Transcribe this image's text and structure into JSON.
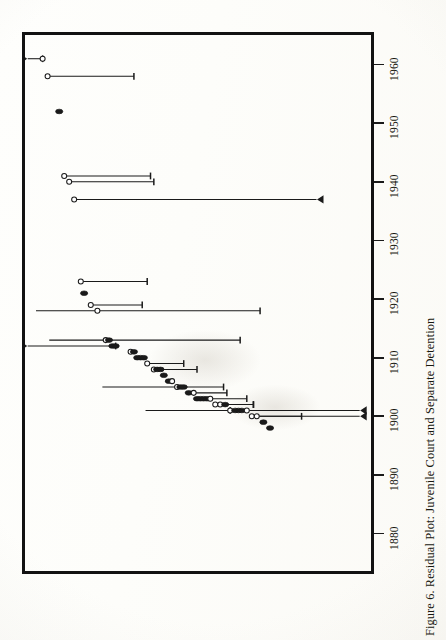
{
  "figure": {
    "caption": "Figure 6.  Residual Plot: Juvenile Court and Separate Detention",
    "caption_number": "Figure 6.",
    "caption_title": "Residual Plot: Juvenile Court and Separate Detention",
    "orientation": "rotated-90-ccw",
    "frame_color": "#121212",
    "ink_color": "#1a1a1a",
    "paper_color": "#fdfdfb"
  },
  "chart_data": {
    "type": "scatter",
    "title": "Residual Plot: Juvenile Court and Separate Detention",
    "xlabel": "",
    "ylabel": "",
    "orientation": "horizontal-intervals",
    "grid": false,
    "legend": null,
    "axis": {
      "name": "year",
      "position": "right",
      "direction": "bottom-to-top",
      "ticks": [
        1880,
        1890,
        1900,
        1910,
        1920,
        1930,
        1940,
        1950,
        1960
      ],
      "tick_labels": [
        "1880",
        "1890",
        "1900",
        "1910",
        "1920",
        "1930",
        "1940",
        "1950",
        "1960"
      ],
      "range": [
        1876,
        1963
      ]
    },
    "residual_axis": {
      "name": "residual",
      "direction": "left-to-right-is-negative",
      "range": [
        -1.0,
        1.0
      ],
      "labeled": false
    },
    "note": "Each observation is a year with a point estimate (circle) and an interval whisker. Open circles = one state group, filled circles = the other. Arrowheads mark intervals truncated by the plot frame.",
    "points": [
      {
        "year": 1961,
        "residual": 0.93,
        "marker": "open",
        "lo": 0.93,
        "hi": 1.02,
        "truncated_hi": true
      },
      {
        "year": 1958,
        "residual": 0.9,
        "marker": "open",
        "lo": 0.38,
        "hi": 0.9,
        "truncated_hi": false
      },
      {
        "year": 1952,
        "residual": 0.83,
        "marker": "filled",
        "lo": 0.83,
        "hi": 0.83,
        "truncated_hi": false
      },
      {
        "year": 1941,
        "residual": 0.8,
        "marker": "open",
        "lo": 0.28,
        "hi": 0.8,
        "truncated_hi": false
      },
      {
        "year": 1940,
        "residual": 0.77,
        "marker": "open",
        "lo": 0.26,
        "hi": 0.77,
        "truncated_hi": false
      },
      {
        "year": 1937,
        "residual": 0.74,
        "marker": "open",
        "lo": -0.72,
        "hi": 0.74,
        "truncated_lo": true
      },
      {
        "year": 1923,
        "residual": 0.7,
        "marker": "open",
        "lo": 0.3,
        "hi": 0.7,
        "truncated_hi": false
      },
      {
        "year": 1921,
        "residual": 0.68,
        "marker": "filled",
        "lo": 0.68,
        "hi": 0.68,
        "truncated_hi": false
      },
      {
        "year": 1919,
        "residual": 0.64,
        "marker": "open",
        "lo": 0.33,
        "hi": 0.64,
        "truncated_hi": false
      },
      {
        "year": 1918,
        "residual": 0.6,
        "marker": "open",
        "lo": -0.38,
        "hi": 0.97,
        "truncated_hi": false
      },
      {
        "year": 1913,
        "residual": 0.55,
        "marker": "open",
        "lo": -0.26,
        "hi": 0.89,
        "truncated_hi": false
      },
      {
        "year": 1913,
        "residual": 0.53,
        "marker": "filled",
        "lo": 0.53,
        "hi": 0.53,
        "truncated_hi": false
      },
      {
        "year": 1912,
        "residual": 0.51,
        "marker": "filled",
        "lo": 0.51,
        "hi": 0.51,
        "truncated_hi": false
      },
      {
        "year": 1912,
        "residual": 0.49,
        "marker": "filled",
        "lo": 0.49,
        "hi": 1.02,
        "truncated_hi": true
      },
      {
        "year": 1911,
        "residual": 0.4,
        "marker": "open",
        "lo": 0.4,
        "hi": 0.4,
        "truncated_hi": false
      },
      {
        "year": 1911,
        "residual": 0.38,
        "marker": "filled",
        "lo": 0.38,
        "hi": 0.38,
        "truncated_hi": false
      },
      {
        "year": 1910,
        "residual": 0.36,
        "marker": "filled",
        "lo": 0.36,
        "hi": 0.36,
        "truncated_hi": false
      },
      {
        "year": 1910,
        "residual": 0.34,
        "marker": "filled",
        "lo": 0.34,
        "hi": 0.34,
        "truncated_hi": false
      },
      {
        "year": 1910,
        "residual": 0.32,
        "marker": "filled",
        "lo": 0.32,
        "hi": 0.32,
        "truncated_hi": false
      },
      {
        "year": 1909,
        "residual": 0.3,
        "marker": "open",
        "lo": 0.08,
        "hi": 0.3,
        "truncated_hi": false
      },
      {
        "year": 1908,
        "residual": 0.26,
        "marker": "open",
        "lo": 0.0,
        "hi": 0.26,
        "truncated_hi": false
      },
      {
        "year": 1908,
        "residual": 0.24,
        "marker": "filled",
        "lo": 0.24,
        "hi": 0.24,
        "truncated_hi": false
      },
      {
        "year": 1908,
        "residual": 0.22,
        "marker": "filled",
        "lo": 0.22,
        "hi": 0.22,
        "truncated_hi": false
      },
      {
        "year": 1907,
        "residual": 0.2,
        "marker": "filled",
        "lo": 0.2,
        "hi": 0.2,
        "truncated_hi": false
      },
      {
        "year": 1906,
        "residual": 0.17,
        "marker": "filled",
        "lo": 0.17,
        "hi": 0.17,
        "truncated_hi": false
      },
      {
        "year": 1906,
        "residual": 0.15,
        "marker": "open",
        "lo": 0.15,
        "hi": 0.15,
        "truncated_hi": false
      },
      {
        "year": 1905,
        "residual": 0.12,
        "marker": "open",
        "lo": -0.16,
        "hi": 0.57,
        "truncated_hi": false
      },
      {
        "year": 1905,
        "residual": 0.1,
        "marker": "filled",
        "lo": 0.1,
        "hi": 0.1,
        "truncated_hi": false
      },
      {
        "year": 1905,
        "residual": 0.08,
        "marker": "filled",
        "lo": 0.08,
        "hi": 0.08,
        "truncated_hi": false
      },
      {
        "year": 1904,
        "residual": 0.05,
        "marker": "filled",
        "lo": 0.05,
        "hi": 0.05,
        "truncated_hi": false
      },
      {
        "year": 1904,
        "residual": 0.02,
        "marker": "open",
        "lo": -0.18,
        "hi": 0.02,
        "truncated_hi": false
      },
      {
        "year": 1903,
        "residual": 0.0,
        "marker": "filled",
        "lo": 0.0,
        "hi": 0.0,
        "truncated_hi": false
      },
      {
        "year": 1903,
        "residual": -0.02,
        "marker": "filled",
        "lo": -0.02,
        "hi": -0.02,
        "truncated_hi": false
      },
      {
        "year": 1903,
        "residual": -0.04,
        "marker": "filled",
        "lo": -0.04,
        "hi": -0.04,
        "truncated_hi": false
      },
      {
        "year": 1903,
        "residual": -0.06,
        "marker": "filled",
        "lo": -0.06,
        "hi": -0.06,
        "truncated_hi": false
      },
      {
        "year": 1903,
        "residual": -0.08,
        "marker": "open",
        "lo": -0.3,
        "hi": -0.08,
        "truncated_hi": false
      },
      {
        "year": 1902,
        "residual": -0.11,
        "marker": "open",
        "lo": -0.34,
        "hi": -0.11,
        "truncated_hi": false
      },
      {
        "year": 1902,
        "residual": -0.14,
        "marker": "open",
        "lo": -0.34,
        "hi": -0.14,
        "truncated_hi": false
      },
      {
        "year": 1902,
        "residual": -0.17,
        "marker": "filled",
        "lo": -0.17,
        "hi": -0.17,
        "truncated_hi": false
      },
      {
        "year": 1901,
        "residual": -0.2,
        "marker": "open",
        "lo": -0.2,
        "hi": 0.31,
        "truncated_hi": false
      },
      {
        "year": 1901,
        "residual": -0.23,
        "marker": "filled",
        "lo": -0.23,
        "hi": -0.23,
        "truncated_hi": false
      },
      {
        "year": 1901,
        "residual": -0.25,
        "marker": "filled",
        "lo": -0.25,
        "hi": -0.25,
        "truncated_hi": false
      },
      {
        "year": 1901,
        "residual": -0.27,
        "marker": "filled",
        "lo": -0.27,
        "hi": -0.27,
        "truncated_hi": false
      },
      {
        "year": 1901,
        "residual": -0.3,
        "marker": "open",
        "lo": -0.98,
        "hi": -0.3,
        "truncated_lo": true
      },
      {
        "year": 1900,
        "residual": -0.33,
        "marker": "open",
        "lo": -0.98,
        "hi": -0.33,
        "truncated_lo": true
      },
      {
        "year": 1900,
        "residual": -0.36,
        "marker": "open",
        "lo": -0.63,
        "hi": -0.36,
        "truncated_hi": false
      },
      {
        "year": 1899,
        "residual": -0.4,
        "marker": "filled",
        "lo": -0.4,
        "hi": -0.4,
        "truncated_hi": false
      },
      {
        "year": 1898,
        "residual": -0.44,
        "marker": "filled",
        "lo": -0.44,
        "hi": -0.44,
        "truncated_hi": false
      }
    ]
  }
}
